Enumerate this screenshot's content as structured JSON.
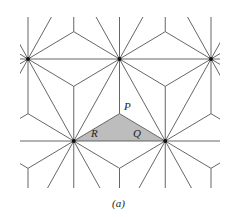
{
  "figure": {
    "caption": "(a)",
    "labels": [
      {
        "id": "P",
        "text": "P",
        "x": 124,
        "y": 101
      },
      {
        "id": "R",
        "text": "R",
        "x": 91,
        "y": 128
      },
      {
        "id": "Q",
        "text": "Q",
        "x": 133,
        "y": 128
      }
    ],
    "lattice": {
      "spacing_x": 91.5,
      "row_height": 82,
      "origin_x": 28,
      "origin_y": 59,
      "clip": {
        "x1": 20,
        "y1": 17,
        "x2": 220,
        "y2": 188
      }
    },
    "shaded_triangle": {
      "vertices": [
        [
          73.5,
          141
        ],
        [
          119.5,
          114
        ],
        [
          165,
          141
        ]
      ],
      "fill": "#bdbdbd"
    },
    "colors": {
      "line": "#555555",
      "node": "#111111"
    }
  }
}
